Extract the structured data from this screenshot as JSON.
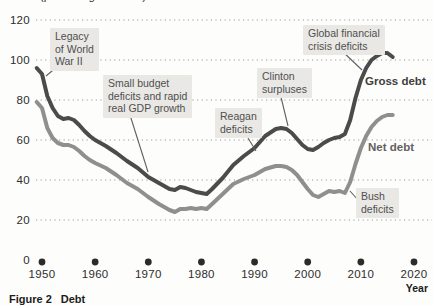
{
  "figure": {
    "label": "Figure 2",
    "title": "Debt",
    "unit_label": "(percentage of GDP)"
  },
  "chart_data": {
    "type": "line",
    "title": "Debt",
    "ylabel": "(percentage of GDP)",
    "xlabel": "Year",
    "xlim": [
      1948,
      2021
    ],
    "ylim": [
      0,
      125
    ],
    "x_ticks": [
      1950,
      1960,
      1970,
      1980,
      1990,
      2000,
      2010,
      2020
    ],
    "y_ticks": [
      0,
      20,
      40,
      60,
      80,
      100,
      120
    ],
    "grid": "horizontal-dotted",
    "legend_position": "inline-right",
    "series": [
      {
        "name": "Gross debt",
        "color": "#4b4b4b",
        "label": {
          "left": 365,
          "top": 75,
          "color": "#3f3f3f"
        },
        "x": [
          1949,
          1950,
          1951,
          1952,
          1953,
          1954,
          1955,
          1956,
          1957,
          1958,
          1959,
          1960,
          1962,
          1964,
          1966,
          1968,
          1970,
          1972,
          1974,
          1975,
          1976,
          1977,
          1978,
          1979,
          1980,
          1981,
          1982,
          1984,
          1986,
          1988,
          1990,
          1992,
          1994,
          1995,
          1996,
          1997,
          1998,
          1999,
          2000,
          2001,
          2002,
          2003,
          2004,
          2005,
          2006,
          2007,
          2008,
          2009,
          2010,
          2011,
          2012,
          2013,
          2014,
          2015,
          2016
        ],
        "values": [
          96,
          93,
          82,
          76,
          72,
          70.5,
          71,
          70,
          67.5,
          64.5,
          62,
          60,
          57,
          53.5,
          49.5,
          46,
          41.5,
          38.5,
          35.5,
          35,
          36.5,
          36,
          35,
          34,
          33.5,
          33,
          35.5,
          41,
          47.5,
          52,
          56,
          62,
          65.5,
          66,
          65.5,
          63.5,
          60.5,
          57.5,
          55.5,
          55,
          56.5,
          58.5,
          60,
          61,
          61.5,
          63,
          70,
          81,
          90,
          96,
          100,
          102,
          103.5,
          103.5,
          101.5
        ]
      },
      {
        "name": "Net debt",
        "color": "#8f8f8f",
        "label": {
          "left": 368,
          "top": 141,
          "color": "#616161"
        },
        "x": [
          1949,
          1950,
          1951,
          1952,
          1953,
          1954,
          1955,
          1956,
          1957,
          1958,
          1959,
          1960,
          1962,
          1964,
          1966,
          1968,
          1970,
          1972,
          1974,
          1975,
          1976,
          1977,
          1978,
          1979,
          1980,
          1981,
          1982,
          1984,
          1986,
          1988,
          1990,
          1992,
          1994,
          1995,
          1996,
          1997,
          1998,
          1999,
          2000,
          2001,
          2002,
          2003,
          2004,
          2005,
          2006,
          2007,
          2008,
          2009,
          2010,
          2011,
          2012,
          2013,
          2014,
          2015,
          2016
        ],
        "values": [
          79,
          76,
          66,
          61,
          58.5,
          57.5,
          57.5,
          56.5,
          54.5,
          52,
          50,
          48.5,
          46,
          42.5,
          38.5,
          35.5,
          31.5,
          28,
          25,
          24,
          25.5,
          25.5,
          26,
          25.5,
          26,
          25.5,
          28,
          33,
          38,
          40.5,
          42.5,
          45.5,
          47,
          47,
          46.5,
          45,
          42.5,
          39,
          35.5,
          32.5,
          31.5,
          33,
          34.5,
          34,
          34.5,
          33.5,
          39,
          48,
          56,
          62,
          66.5,
          69.5,
          71.5,
          72.5,
          72.5
        ]
      }
    ],
    "annotations": [
      {
        "id": "legacy-of-world-war-ii",
        "lines": [
          "Legacy",
          "of World",
          "War II"
        ],
        "box_px": {
          "left": 50,
          "top": 28
        },
        "leader_px": [
          [
            58,
            66
          ],
          [
            46,
            76
          ]
        ]
      },
      {
        "id": "small-budget-deficits",
        "lines": [
          "Small budget",
          "deficits and rapid",
          "real GDP growth"
        ],
        "box_px": {
          "left": 103,
          "top": 75
        },
        "leader_px": [
          [
            130,
            115
          ],
          [
            148,
            172
          ]
        ]
      },
      {
        "id": "reagan-deficits",
        "lines": [
          "Reagan",
          "deficits"
        ],
        "box_px": {
          "left": 215,
          "top": 108
        },
        "leader_px": [
          [
            248,
            138
          ],
          [
            256,
            151
          ]
        ]
      },
      {
        "id": "clinton-surpluses",
        "lines": [
          "Clinton",
          "surpluses"
        ],
        "box_px": {
          "left": 257,
          "top": 68
        },
        "leader_px": [
          [
            280,
            93
          ],
          [
            288,
            126
          ]
        ]
      },
      {
        "id": "global-financial-crisis-deficits",
        "lines": [
          "Global financial",
          "crisis deficits"
        ],
        "box_px": {
          "left": 303,
          "top": 25
        },
        "leader_px": [
          [
            341,
            50
          ],
          [
            362,
            70
          ]
        ]
      },
      {
        "id": "bush-deficits",
        "lines": [
          "Bush",
          "deficits"
        ],
        "box_px": {
          "left": 356,
          "top": 188
        },
        "leader_px": [
          [
            358,
            200
          ],
          [
            350,
            191
          ]
        ]
      }
    ]
  },
  "colors": {
    "background": "#fdfdfb",
    "grid": "#9b9b9b",
    "axis_dot": "#2b2b2b",
    "tick_text": "#2e2e2e",
    "annotation_bg": "#e9e8e5",
    "annotation_text": "#4f4f4f",
    "leader": "#606060",
    "caption_text": "#1c1c1c"
  }
}
